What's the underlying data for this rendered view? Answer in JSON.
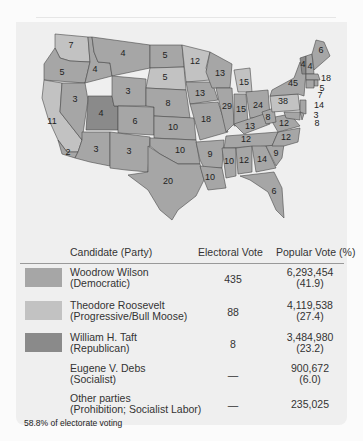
{
  "colors": {
    "wilson": "#a6a6a6",
    "roosevelt": "#c2c2c2",
    "taft": "#8a8a8a",
    "panel": "#efefef"
  },
  "map": {
    "states": [
      {
        "state": "WA",
        "ev": "7",
        "winner": "roosevelt"
      },
      {
        "state": "OR",
        "ev": "5",
        "winner": "wilson"
      },
      {
        "state": "CA",
        "ev": "11",
        "winner": "roosevelt"
      },
      {
        "state": "CA-south",
        "ev": "2",
        "winner": "wilson"
      },
      {
        "state": "ID",
        "ev": "4",
        "winner": "wilson"
      },
      {
        "state": "NV",
        "ev": "3",
        "winner": "wilson"
      },
      {
        "state": "UT",
        "ev": "4",
        "winner": "taft"
      },
      {
        "state": "AZ",
        "ev": "3",
        "winner": "wilson"
      },
      {
        "state": "MT",
        "ev": "4",
        "winner": "wilson"
      },
      {
        "state": "WY",
        "ev": "3",
        "winner": "wilson"
      },
      {
        "state": "CO",
        "ev": "6",
        "winner": "wilson"
      },
      {
        "state": "NM",
        "ev": "3",
        "winner": "wilson"
      },
      {
        "state": "ND",
        "ev": "5",
        "winner": "wilson"
      },
      {
        "state": "SD",
        "ev": "5",
        "winner": "roosevelt"
      },
      {
        "state": "NE",
        "ev": "8",
        "winner": "wilson"
      },
      {
        "state": "KS",
        "ev": "10",
        "winner": "wilson"
      },
      {
        "state": "OK",
        "ev": "10",
        "winner": "wilson"
      },
      {
        "state": "TX",
        "ev": "20",
        "winner": "wilson"
      },
      {
        "state": "MN",
        "ev": "12",
        "winner": "roosevelt"
      },
      {
        "state": "IA",
        "ev": "13",
        "winner": "wilson"
      },
      {
        "state": "MO",
        "ev": "18",
        "winner": "wilson"
      },
      {
        "state": "AR",
        "ev": "9",
        "winner": "wilson"
      },
      {
        "state": "LA",
        "ev": "10",
        "winner": "wilson"
      },
      {
        "state": "WI",
        "ev": "13",
        "winner": "wilson"
      },
      {
        "state": "IL",
        "ev": "29",
        "winner": "wilson"
      },
      {
        "state": "MI",
        "ev": "15",
        "winner": "roosevelt"
      },
      {
        "state": "IN",
        "ev": "15",
        "winner": "wilson"
      },
      {
        "state": "OH",
        "ev": "24",
        "winner": "wilson"
      },
      {
        "state": "KY",
        "ev": "13",
        "winner": "wilson"
      },
      {
        "state": "TN",
        "ev": "12",
        "winner": "wilson"
      },
      {
        "state": "MS",
        "ev": "10",
        "winner": "wilson"
      },
      {
        "state": "AL",
        "ev": "12",
        "winner": "wilson"
      },
      {
        "state": "GA",
        "ev": "14",
        "winner": "wilson"
      },
      {
        "state": "FL",
        "ev": "6",
        "winner": "wilson"
      },
      {
        "state": "SC",
        "ev": "9",
        "winner": "wilson"
      },
      {
        "state": "NC",
        "ev": "12",
        "winner": "wilson"
      },
      {
        "state": "VA",
        "ev": "12",
        "winner": "wilson"
      },
      {
        "state": "WV",
        "ev": "8",
        "winner": "wilson"
      },
      {
        "state": "PA",
        "ev": "38",
        "winner": "roosevelt"
      },
      {
        "state": "NY",
        "ev": "45",
        "winner": "wilson"
      },
      {
        "state": "VT",
        "ev": "4",
        "winner": "taft"
      },
      {
        "state": "NH",
        "ev": "4",
        "winner": "wilson"
      },
      {
        "state": "ME",
        "ev": "6",
        "winner": "wilson"
      },
      {
        "state": "MA",
        "ev": "18",
        "winner": "wilson"
      },
      {
        "state": "RI",
        "ev": "5",
        "winner": "wilson"
      },
      {
        "state": "CT",
        "ev": "7",
        "winner": "wilson"
      },
      {
        "state": "NJ",
        "ev": "14",
        "winner": "wilson"
      },
      {
        "state": "DE",
        "ev": "3",
        "winner": "wilson"
      },
      {
        "state": "MD",
        "ev": "8",
        "winner": "wilson"
      }
    ]
  },
  "table": {
    "headers": {
      "candidate": "Candidate (Party)",
      "electoral": "Electoral Vote",
      "popular": "Popular Vote (%)"
    },
    "rows": [
      {
        "name": "Woodrow Wilson",
        "party": "(Democratic)",
        "ev": "435",
        "pv": "6,293,454",
        "pct": "(41.9)",
        "swatch": "wilson"
      },
      {
        "name": "Theodore Roosevelt",
        "party": "(Progressive/Bull Moose)",
        "ev": "88",
        "pv": "4,119,538",
        "pct": "(27.4)",
        "swatch": "roosevelt"
      },
      {
        "name": "William H. Taft",
        "party": "(Republican)",
        "ev": "8",
        "pv": "3,484,980",
        "pct": "(23.2)",
        "swatch": "taft"
      },
      {
        "name": "Eugene V. Debs",
        "party": "(Socialist)",
        "ev": "—",
        "pv": "900,672",
        "pct": "(6.0)",
        "swatch": ""
      },
      {
        "name": "Other parties",
        "party": "(Prohibition; Socialist Labor)",
        "ev": "—",
        "pv": "235,025",
        "pct": "",
        "swatch": ""
      }
    ],
    "note": "58.8% of electorate voting"
  }
}
